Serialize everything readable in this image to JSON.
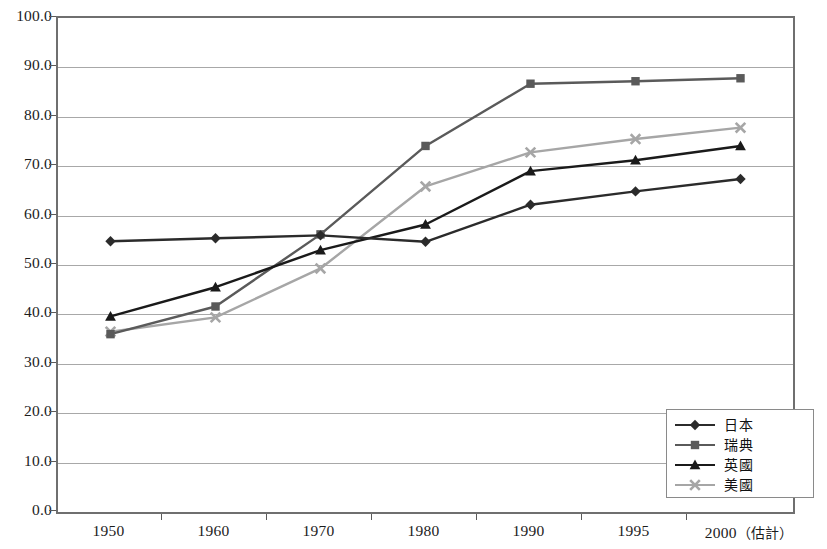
{
  "chart_data": {
    "type": "line",
    "title": "",
    "subtitle": "",
    "xlabel": "",
    "ylabel": "",
    "categories": [
      "1950",
      "1960",
      "1970",
      "1980",
      "1990",
      "1995",
      "2000"
    ],
    "x_last_note": "（估計）",
    "ylim": [
      0.0,
      100.0
    ],
    "ytick_step": 10.0,
    "yticks": [
      "0.0",
      "10.0",
      "20.0",
      "30.0",
      "40.0",
      "50.0",
      "60.0",
      "70.0",
      "80.0",
      "90.0",
      "100.0"
    ],
    "grid": true,
    "legend_position": "inside-bottom-right",
    "series": [
      {
        "name": "日本",
        "marker": "diamond",
        "color": "#2b2b2b",
        "values": [
          54.8,
          55.4,
          56.0,
          54.7,
          62.2,
          64.9,
          67.4
        ]
      },
      {
        "name": "瑞典",
        "marker": "square",
        "color": "#5a5a5a",
        "values": [
          36.0,
          41.6,
          56.2,
          74.1,
          86.7,
          87.2,
          87.8
        ]
      },
      {
        "name": "英國",
        "marker": "triangle",
        "color": "#1a1a1a",
        "values": [
          39.6,
          45.5,
          53.0,
          58.2,
          69.0,
          71.2,
          74.1
        ]
      },
      {
        "name": "美國",
        "marker": "cross-x",
        "color": "#a6a6a6",
        "values": [
          36.5,
          39.4,
          49.3,
          65.9,
          72.8,
          75.5,
          77.8
        ]
      }
    ]
  },
  "axes": {
    "frame_color": "#6f6f6f",
    "grid_color": "#a8a8a8",
    "tick_color": "#5a5a5a",
    "label_color": "#1c1c1c"
  },
  "legend": {
    "border_color": "#8a8a8a",
    "background": "#ffffff"
  }
}
